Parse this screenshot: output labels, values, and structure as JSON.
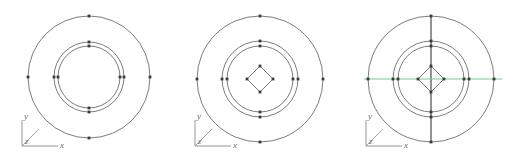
{
  "canvas": {
    "width": 519,
    "height": 162,
    "background": "#ffffff"
  },
  "style": {
    "geometry_stroke": "#5a5a5a",
    "centerline_vertical_color": "#3a3a3a",
    "centerline_horizontal_color": "#6fcf8d",
    "vertex_marker_color": "#3a3a3a",
    "axis_triad_color": "#8a8a8a",
    "axis_label_color": "#6b6b6b"
  },
  "axis_triad": {
    "x_label": "x",
    "y_label": "y",
    "z_label": "z"
  },
  "panels": [
    {
      "id": "panel-1",
      "name": "concentric-circles-only",
      "origin_x": 0,
      "center": {
        "cx": 89,
        "cy": 77
      },
      "circles": [
        {
          "name": "outer-circle",
          "r": 61
        },
        {
          "name": "middle-circle",
          "r": 35
        },
        {
          "name": "inner-circle",
          "r": 31
        }
      ],
      "diamond": null,
      "vertical_centerline": false,
      "horizontal_centerline": false,
      "markers": [
        {
          "x": 89,
          "y": 16
        },
        {
          "x": 89,
          "y": 138
        },
        {
          "x": 28,
          "y": 77
        },
        {
          "x": 150,
          "y": 77
        },
        {
          "x": 89,
          "y": 42
        },
        {
          "x": 89,
          "y": 112
        },
        {
          "x": 54,
          "y": 77
        },
        {
          "x": 124,
          "y": 77
        },
        {
          "x": 89,
          "y": 46
        },
        {
          "x": 89,
          "y": 108
        },
        {
          "x": 58,
          "y": 77
        },
        {
          "x": 120,
          "y": 77
        }
      ],
      "axis_origin": {
        "x": 22,
        "y": 146
      }
    },
    {
      "id": "panel-2",
      "name": "concentric-circles-with-diamond",
      "origin_x": 173,
      "center": {
        "cx": 87,
        "cy": 79
      },
      "circles": [
        {
          "name": "outer-circle",
          "r": 63
        },
        {
          "name": "middle-circle",
          "r": 38
        },
        {
          "name": "inner-circle",
          "r": 33
        }
      ],
      "diamond": {
        "name": "center-diamond",
        "half_diagonal": 13
      },
      "vertical_centerline": false,
      "horizontal_centerline": false,
      "markers": [
        {
          "x": 87,
          "y": 16
        },
        {
          "x": 87,
          "y": 142
        },
        {
          "x": 24,
          "y": 79
        },
        {
          "x": 150,
          "y": 79
        },
        {
          "x": 87,
          "y": 41
        },
        {
          "x": 87,
          "y": 117
        },
        {
          "x": 49,
          "y": 79
        },
        {
          "x": 125,
          "y": 79
        },
        {
          "x": 87,
          "y": 46
        },
        {
          "x": 87,
          "y": 112
        },
        {
          "x": 54,
          "y": 79
        },
        {
          "x": 120,
          "y": 79
        },
        {
          "x": 87,
          "y": 66
        },
        {
          "x": 87,
          "y": 92
        },
        {
          "x": 74,
          "y": 79
        },
        {
          "x": 100,
          "y": 79
        }
      ],
      "axis_origin": {
        "x": 22,
        "y": 146
      }
    },
    {
      "id": "panel-3",
      "name": "concentric-circles-with-diamond-and-centerlines",
      "origin_x": 346,
      "center": {
        "cx": 85,
        "cy": 79
      },
      "circles": [
        {
          "name": "outer-circle",
          "r": 63
        },
        {
          "name": "middle-circle",
          "r": 38
        },
        {
          "name": "inner-circle",
          "r": 33
        }
      ],
      "diamond": {
        "name": "center-diamond",
        "half_diagonal": 13
      },
      "vertical_centerline": true,
      "horizontal_centerline": true,
      "markers": [
        {
          "x": 85,
          "y": 16
        },
        {
          "x": 85,
          "y": 142
        },
        {
          "x": 22,
          "y": 79
        },
        {
          "x": 148,
          "y": 79
        },
        {
          "x": 85,
          "y": 41
        },
        {
          "x": 85,
          "y": 117
        },
        {
          "x": 47,
          "y": 79
        },
        {
          "x": 123,
          "y": 79
        },
        {
          "x": 85,
          "y": 46
        },
        {
          "x": 85,
          "y": 112
        },
        {
          "x": 52,
          "y": 79
        },
        {
          "x": 118,
          "y": 79
        },
        {
          "x": 85,
          "y": 66
        },
        {
          "x": 85,
          "y": 92
        },
        {
          "x": 72,
          "y": 79
        },
        {
          "x": 98,
          "y": 79
        }
      ],
      "axis_origin": {
        "x": 20,
        "y": 146
      }
    }
  ]
}
